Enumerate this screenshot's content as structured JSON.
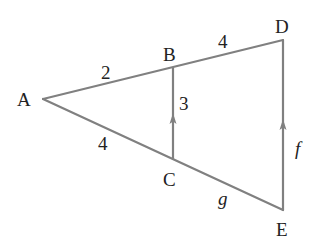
{
  "diagram": {
    "type": "similar-triangles",
    "colors": {
      "line": "#808080",
      "text": "#222222",
      "background": "#ffffff"
    },
    "points": {
      "A": {
        "label": "A",
        "x": 43,
        "y": 99
      },
      "B": {
        "label": "B",
        "x": 173,
        "y": 68
      },
      "C": {
        "label": "C",
        "x": 173,
        "y": 159
      },
      "D": {
        "label": "D",
        "x": 283,
        "y": 40
      },
      "E": {
        "label": "E",
        "x": 283,
        "y": 210
      }
    },
    "segments": [
      {
        "from": "A",
        "to": "B",
        "label": "2"
      },
      {
        "from": "B",
        "to": "D",
        "label": "4"
      },
      {
        "from": "A",
        "to": "C",
        "label": "4"
      },
      {
        "from": "C",
        "to": "E",
        "label": "g"
      },
      {
        "from": "C",
        "to": "B",
        "label": "3",
        "parallel_arrow": true
      },
      {
        "from": "E",
        "to": "D",
        "label": "f",
        "parallel_arrow": true
      }
    ]
  },
  "labels": {
    "vertex_A": "A",
    "vertex_B": "B",
    "vertex_C": "C",
    "vertex_D": "D",
    "vertex_E": "E",
    "seg_AB": "2",
    "seg_BD": "4",
    "seg_AC": "4",
    "seg_CE": "g",
    "seg_BC": "3",
    "seg_DE": "f"
  }
}
